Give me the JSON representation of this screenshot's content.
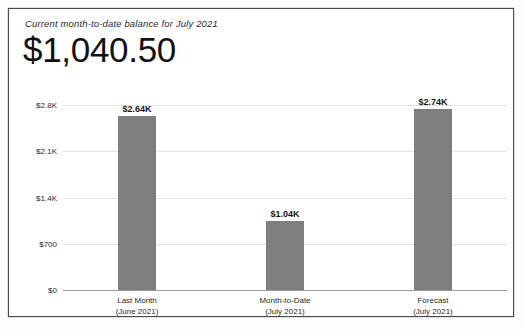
{
  "card": {
    "title": "Current month-to-date balance for July 2021",
    "value": "$1,040.50"
  },
  "chart_data": {
    "type": "bar",
    "title": "Current month-to-date balance for July 2021",
    "xlabel": "",
    "ylabel": "",
    "ylim": [
      0,
      2800
    ],
    "grid": true,
    "legend": "none",
    "bar_color": "#7e7e7e",
    "gridline_color": "#e4e4e4",
    "axis_color": "#9a9a9a",
    "yticks": [
      {
        "value": 2800,
        "label": "$2.8K"
      },
      {
        "value": 2100,
        "label": "$2.1K"
      },
      {
        "value": 1400,
        "label": "$1.4K"
      },
      {
        "value": 700,
        "label": "$700"
      },
      {
        "value": 0,
        "label": "$0"
      }
    ],
    "categories": [
      "Last Month (June 2021)",
      "Month-to-Date (July 2021)",
      "Forecast (July 2021)"
    ],
    "values": [
      2640,
      1040,
      2740
    ],
    "bars": [
      {
        "category_line1": "Last Month",
        "category_line2": "(June 2021)",
        "value": 2640,
        "value_label": "$2.64K"
      },
      {
        "category_line1": "Month-to-Date",
        "category_line2": "(July 2021)",
        "value": 1040,
        "value_label": "$1.04K"
      },
      {
        "category_line1": "Forecast",
        "category_line2": "(July 2021)",
        "value": 2740,
        "value_label": "$2.74K"
      }
    ]
  }
}
